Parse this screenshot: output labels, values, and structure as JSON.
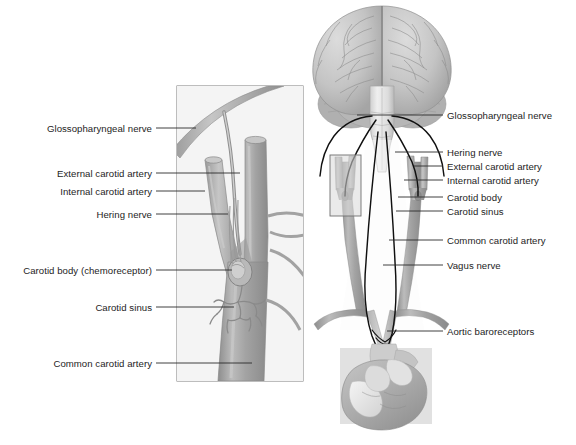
{
  "figure": {
    "background_color": "#ffffff",
    "text_color": "#1d1d1d",
    "leader_line_color": "#2b2b2b",
    "artery_color": "#a0a0a0",
    "artery_shade_color": "#8a8a8a",
    "artery_highlight_color": "#cfcfcf",
    "nerve_color": "#111111",
    "brain_color": "#c6c6c6",
    "brain_shade_color": "#aeaeae",
    "brainstem_color": "#e4e4e4",
    "heart_color": "#b4b4b4",
    "heart_light_color": "#efefef",
    "heart_mid_color": "#9a9a9a",
    "inset_background": "#f2f2f2",
    "inset_border": "#7d7d7d",
    "callout_background": "#e3e3e3",
    "callout_border": "#6f6f6f"
  },
  "inset_panel": {
    "name": "carotid-bifurcation-detail",
    "x": 177,
    "y": 86,
    "width": 126,
    "height": 295
  },
  "callout_box": {
    "name": "carotid-bifurcation-callout",
    "x": 330,
    "y": 155,
    "width": 31,
    "height": 61
  },
  "labels_left": [
    {
      "id": "glossopharyngeal-nerve",
      "text": "Glossopharyngeal nerve",
      "text_right": 152,
      "y": 128,
      "line_x1": 156,
      "line_x2": 196,
      "line_y": 128
    },
    {
      "id": "external-carotid-artery",
      "text": "External carotid artery",
      "text_right": 152,
      "y": 173,
      "line_x1": 156,
      "line_x2": 240,
      "line_y": 173
    },
    {
      "id": "internal-carotid-artery",
      "text": "Internal carotid artery",
      "text_right": 152,
      "y": 191,
      "line_x1": 156,
      "line_x2": 205,
      "line_y": 191
    },
    {
      "id": "hering-nerve",
      "text": "Hering nerve",
      "text_right": 152,
      "y": 214,
      "line_x1": 156,
      "line_x2": 228,
      "line_y": 214
    },
    {
      "id": "carotid-body-chemoreceptor",
      "text": "Carotid body (chemoreceptor)",
      "text_right": 152,
      "y": 270,
      "line_x1": 156,
      "line_x2": 232,
      "line_y": 270
    },
    {
      "id": "carotid-sinus",
      "text": "Carotid sinus",
      "text_right": 152,
      "y": 307,
      "line_x1": 156,
      "line_x2": 234,
      "line_y": 307
    },
    {
      "id": "common-carotid-artery-inset",
      "text": "Common carotid artery",
      "text_right": 152,
      "y": 363,
      "line_x1": 156,
      "line_x2": 252,
      "line_y": 363
    }
  ],
  "labels_right": [
    {
      "id": "glossopharyngeal-nerve-main",
      "text": "Glossopharyngeal nerve",
      "text_left": 447,
      "y": 115,
      "line_x1": 357,
      "line_x2": 443,
      "line_y": 115
    },
    {
      "id": "hering-nerve-main",
      "text": "Hering nerve",
      "text_left": 447,
      "y": 152,
      "line_x1": 395,
      "line_x2": 443,
      "line_y": 152
    },
    {
      "id": "external-carotid-artery-main",
      "text": "External carotid artery",
      "text_left": 447,
      "y": 166,
      "line_x1": 414,
      "line_x2": 443,
      "line_y": 166
    },
    {
      "id": "internal-carotid-artery-main",
      "text": "Internal carotid artery",
      "text_left": 447,
      "y": 180,
      "line_x1": 404,
      "line_x2": 443,
      "line_y": 180
    },
    {
      "id": "carotid-body-main",
      "text": "Carotid body",
      "text_left": 447,
      "y": 197,
      "line_x1": 398,
      "line_x2": 443,
      "line_y": 197
    },
    {
      "id": "carotid-sinus-main",
      "text": "Carotid sinus",
      "text_left": 447,
      "y": 211,
      "line_x1": 396,
      "line_x2": 443,
      "line_y": 211
    },
    {
      "id": "common-carotid-artery-main",
      "text": "Common carotid artery",
      "text_left": 447,
      "y": 240,
      "line_x1": 389,
      "line_x2": 443,
      "line_y": 240
    },
    {
      "id": "vagus-nerve",
      "text": "Vagus nerve",
      "text_left": 447,
      "y": 265,
      "line_x1": 383,
      "line_x2": 443,
      "line_y": 265
    },
    {
      "id": "aortic-baroreceptors",
      "text": "Aortic baroreceptors",
      "text_left": 447,
      "y": 331,
      "line_x1": 387,
      "line_x2": 443,
      "line_y": 331
    }
  ]
}
